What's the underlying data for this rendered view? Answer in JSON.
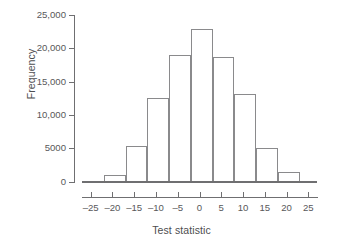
{
  "chart_data": {
    "type": "bar",
    "subtype": "histogram",
    "title": "",
    "xlabel": "Test statistic",
    "ylabel": "Frequency",
    "xlim": [
      -27,
      27
    ],
    "ylim": [
      0,
      25000
    ],
    "grid": false,
    "legend": null,
    "bin_width": 5,
    "bin_edges": [
      -27,
      -22,
      -17,
      -12,
      -7,
      -2,
      3,
      8,
      13,
      18,
      23,
      27
    ],
    "bin_centers": [
      -24.5,
      -19.5,
      -14.5,
      -9.5,
      -4.5,
      0.5,
      5.5,
      10.5,
      15.5,
      20.5,
      25
    ],
    "values": [
      100,
      1000,
      5300,
      12500,
      19000,
      22900,
      18700,
      13100,
      5100,
      1500,
      150
    ],
    "xticks": [
      -25,
      -20,
      -15,
      -10,
      -5,
      0,
      5,
      10,
      15,
      20,
      25
    ],
    "xticklabels": [
      "–25",
      "–20",
      "–15",
      "–10",
      "–5",
      "0",
      "5",
      "10",
      "15",
      "20",
      "25"
    ],
    "yticks": [
      0,
      5000,
      10000,
      15000,
      20000,
      25000
    ],
    "yticklabels": [
      "0",
      "5000",
      "10,000",
      "15,000",
      "20,000",
      "25,000"
    ],
    "colors": {
      "bar_fill": "#ffffff",
      "bar_edge": "#8a8a8c",
      "axis": "#6f6f71",
      "text": "#58585a",
      "background": "#ffffff"
    }
  }
}
